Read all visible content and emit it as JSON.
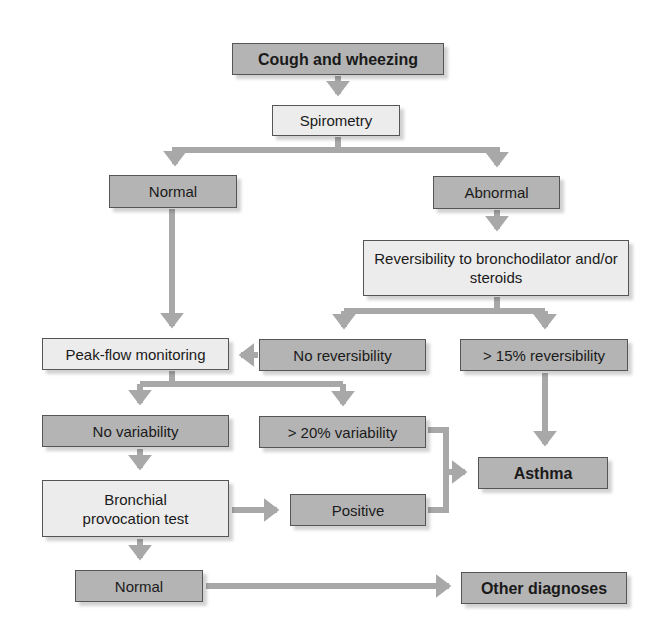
{
  "diagram": {
    "type": "flowchart",
    "colors": {
      "dark_box": "#b4b4b4",
      "light_box": "#ececec",
      "border": "#555555",
      "arrow": "#a8a8a8",
      "text": "#1a1a1a"
    },
    "nodes": {
      "cough": "Cough and wheezing",
      "spirometry": "Spirometry",
      "normal_top": "Normal",
      "abnormal": "Abnormal",
      "reversibility": "Reversibility to bronchodilator and/or steroids",
      "peak_flow": "Peak-flow monitoring",
      "no_reversibility": "No reversibility",
      "gt15_reversibility": "> 15% reversibility",
      "no_variability": "No variability",
      "gt20_variability": "> 20% variability",
      "asthma": "Asthma",
      "bronchial": "Bronchial provocation test",
      "positive": "Positive",
      "normal_bottom": "Normal",
      "other_diagnoses": "Other diagnoses"
    },
    "edges": [
      [
        "cough",
        "spirometry"
      ],
      [
        "spirometry",
        "normal_top"
      ],
      [
        "spirometry",
        "abnormal"
      ],
      [
        "abnormal",
        "reversibility"
      ],
      [
        "reversibility",
        "no_reversibility"
      ],
      [
        "reversibility",
        "gt15_reversibility"
      ],
      [
        "normal_top",
        "peak_flow"
      ],
      [
        "no_reversibility",
        "peak_flow"
      ],
      [
        "gt15_reversibility",
        "asthma"
      ],
      [
        "peak_flow",
        "no_variability"
      ],
      [
        "peak_flow",
        "gt20_variability"
      ],
      [
        "gt20_variability",
        "asthma"
      ],
      [
        "no_variability",
        "bronchial"
      ],
      [
        "bronchial",
        "positive"
      ],
      [
        "positive",
        "asthma"
      ],
      [
        "bronchial",
        "normal_bottom"
      ],
      [
        "normal_bottom",
        "other_diagnoses"
      ]
    ]
  }
}
